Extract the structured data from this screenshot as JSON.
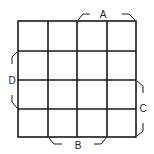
{
  "diagram": {
    "type": "karnaugh-map",
    "rows": 4,
    "columns": 4,
    "line_color": "#1a1a1a",
    "labels": {
      "top": "A",
      "left": "D",
      "right": "C",
      "bottom": "B"
    },
    "brackets": {
      "A": {
        "side": "top",
        "spans_columns": [
          3,
          4
        ]
      },
      "D": {
        "side": "left",
        "spans_rows": [
          2,
          3
        ]
      },
      "C": {
        "side": "right",
        "spans_rows": [
          3,
          4
        ]
      },
      "B": {
        "side": "bottom",
        "spans_columns": [
          2,
          3
        ]
      }
    },
    "cells": [
      [
        "",
        "",
        "",
        ""
      ],
      [
        "",
        "",
        "",
        ""
      ],
      [
        "",
        "",
        "",
        ""
      ],
      [
        "",
        "",
        "",
        ""
      ]
    ]
  }
}
